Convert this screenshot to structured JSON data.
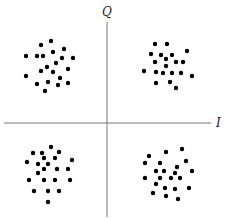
{
  "diagram": {
    "type": "constellation-scatter",
    "axes": {
      "horizontal_label": "I",
      "vertical_label": "Q",
      "origin": [
        107,
        123
      ],
      "color": "#777777"
    },
    "point_color": "#000000",
    "clusters": [
      {
        "name": "top-left",
        "points": [
          [
            41,
            45
          ],
          [
            51,
            41
          ],
          [
            53,
            52
          ],
          [
            64,
            49
          ],
          [
            26,
            56
          ],
          [
            37,
            56
          ],
          [
            43,
            56
          ],
          [
            62,
            58
          ],
          [
            73,
            58
          ],
          [
            56,
            63
          ],
          [
            47,
            67
          ],
          [
            41,
            71
          ],
          [
            53,
            72
          ],
          [
            68,
            69
          ],
          [
            26,
            76
          ],
          [
            60,
            78
          ],
          [
            48,
            82
          ],
          [
            37,
            84
          ],
          [
            58,
            85
          ],
          [
            68,
            83
          ],
          [
            45,
            91
          ]
        ]
      },
      {
        "name": "top-right",
        "points": [
          [
            155,
            44
          ],
          [
            167,
            44
          ],
          [
            151,
            54
          ],
          [
            161,
            55
          ],
          [
            172,
            55
          ],
          [
            187,
            51
          ],
          [
            155,
            62
          ],
          [
            166,
            59
          ],
          [
            176,
            62
          ],
          [
            183,
            62
          ],
          [
            166,
            66
          ],
          [
            144,
            71
          ],
          [
            156,
            72
          ],
          [
            163,
            73
          ],
          [
            172,
            73
          ],
          [
            181,
            73
          ],
          [
            192,
            76
          ],
          [
            156,
            83
          ],
          [
            170,
            82
          ],
          [
            176,
            88
          ]
        ]
      },
      {
        "name": "bottom-left",
        "points": [
          [
            51,
            147
          ],
          [
            33,
            153
          ],
          [
            42,
            153
          ],
          [
            59,
            152
          ],
          [
            44,
            158
          ],
          [
            55,
            158
          ],
          [
            27,
            162
          ],
          [
            38,
            164
          ],
          [
            48,
            164
          ],
          [
            72,
            160
          ],
          [
            44,
            169
          ],
          [
            57,
            169
          ],
          [
            68,
            169
          ],
          [
            38,
            173
          ],
          [
            29,
            180
          ],
          [
            44,
            180
          ],
          [
            55,
            180
          ],
          [
            70,
            180
          ],
          [
            34,
            191
          ],
          [
            48,
            191
          ],
          [
            59,
            191
          ],
          [
            48,
            202
          ]
        ]
      },
      {
        "name": "bottom-right",
        "points": [
          [
            166,
            152
          ],
          [
            182,
            149
          ],
          [
            149,
            156
          ],
          [
            145,
            163
          ],
          [
            160,
            163
          ],
          [
            186,
            161
          ],
          [
            177,
            167
          ],
          [
            156,
            171
          ],
          [
            164,
            171
          ],
          [
            192,
            171
          ],
          [
            175,
            173
          ],
          [
            145,
            178
          ],
          [
            160,
            178
          ],
          [
            171,
            178
          ],
          [
            180,
            178
          ],
          [
            156,
            184
          ],
          [
            165,
            188
          ],
          [
            175,
            189
          ],
          [
            189,
            188
          ],
          [
            153,
            193
          ],
          [
            166,
            196
          ],
          [
            178,
            199
          ]
        ]
      }
    ]
  }
}
